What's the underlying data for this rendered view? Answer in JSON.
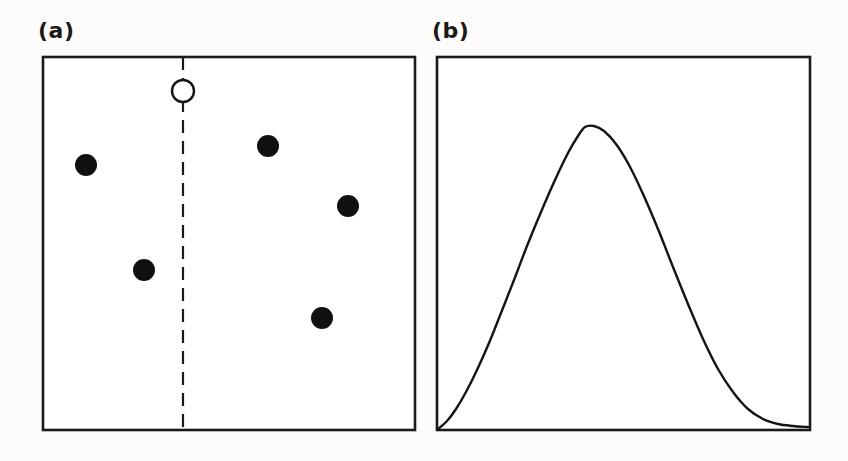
{
  "figure": {
    "background_color": "#fdfcfa",
    "ink_color": "#141414",
    "panel_a_label": "(a)",
    "panel_b_label": "(b)"
  },
  "chart_data": [
    {
      "type": "scatter",
      "panel": "(a)",
      "title": "",
      "xlabel": "",
      "ylabel": "",
      "xlim": [
        0,
        100
      ],
      "ylim": [
        0,
        100
      ],
      "grid": false,
      "legend": "none",
      "frame": {
        "x": 43,
        "y": 57,
        "width": 372,
        "height": 373
      },
      "series": [
        {
          "name": "filled-points",
          "marker": "filled-circle",
          "marker_color": "#101010",
          "marker_radius_px": 11,
          "points": [
            {
              "id": "p1",
              "x_px": 86,
              "y_px": 165
            },
            {
              "id": "p2",
              "x_px": 144,
              "y_px": 270
            },
            {
              "id": "p3",
              "x_px": 268,
              "y_px": 146
            },
            {
              "id": "p4",
              "x_px": 348,
              "y_px": 206
            },
            {
              "id": "p5",
              "x_px": 322,
              "y_px": 318
            }
          ]
        },
        {
          "name": "open-point",
          "marker": "open-circle",
          "marker_color": "#ffffff",
          "marker_edge_color": "#141414",
          "marker_radius_px": 11,
          "points": [
            {
              "id": "p0",
              "x_px": 183,
              "y_px": 91
            }
          ]
        }
      ],
      "annotations": [
        {
          "name": "vertical-dashed-divider",
          "type": "vline",
          "x_px": 183,
          "y_start_px": 57,
          "y_end_px": 430,
          "style": "dashed",
          "dash_on_px": 13,
          "dash_off_px": 8
        }
      ]
    },
    {
      "type": "line",
      "panel": "(b)",
      "title": "",
      "xlabel": "",
      "ylabel": "",
      "xlim": [
        0,
        1
      ],
      "ylim": [
        0,
        1
      ],
      "grid": false,
      "legend": "none",
      "frame": {
        "x": 437,
        "y": 57,
        "width": 373,
        "height": 373
      },
      "description": "smooth unimodal right-skewed distribution curve",
      "peak": {
        "x_px": 585,
        "y_px": 126,
        "x_norm": 0.4,
        "y_norm": 0.82
      },
      "curve_points_px": [
        {
          "x": 438,
          "y": 429
        },
        {
          "x": 447,
          "y": 421
        },
        {
          "x": 456,
          "y": 409
        },
        {
          "x": 466,
          "y": 392
        },
        {
          "x": 477,
          "y": 370
        },
        {
          "x": 489,
          "y": 343
        },
        {
          "x": 501,
          "y": 313
        },
        {
          "x": 514,
          "y": 280
        },
        {
          "x": 527,
          "y": 246
        },
        {
          "x": 541,
          "y": 212
        },
        {
          "x": 555,
          "y": 180
        },
        {
          "x": 568,
          "y": 153
        },
        {
          "x": 578,
          "y": 136
        },
        {
          "x": 585,
          "y": 127
        },
        {
          "x": 594,
          "y": 126
        },
        {
          "x": 604,
          "y": 131
        },
        {
          "x": 616,
          "y": 144
        },
        {
          "x": 629,
          "y": 165
        },
        {
          "x": 643,
          "y": 194
        },
        {
          "x": 658,
          "y": 229
        },
        {
          "x": 673,
          "y": 267
        },
        {
          "x": 688,
          "y": 304
        },
        {
          "x": 703,
          "y": 339
        },
        {
          "x": 718,
          "y": 369
        },
        {
          "x": 733,
          "y": 392
        },
        {
          "x": 748,
          "y": 409
        },
        {
          "x": 763,
          "y": 419
        },
        {
          "x": 778,
          "y": 424
        },
        {
          "x": 793,
          "y": 426
        },
        {
          "x": 808,
          "y": 427
        }
      ]
    }
  ]
}
